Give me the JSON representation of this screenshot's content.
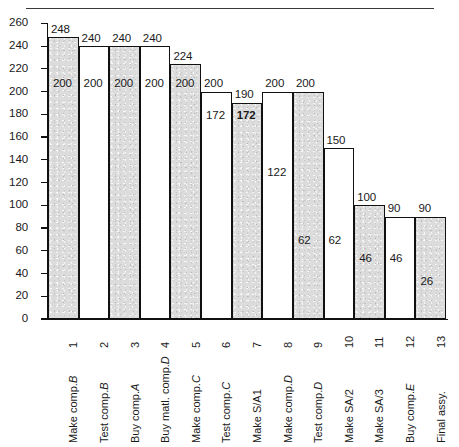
{
  "chart_data": {
    "type": "bar",
    "title": "",
    "subtitle": "",
    "xlabel": "",
    "ylabel": "",
    "ylim": [
      0,
      260
    ],
    "y_ticks": [
      0,
      20,
      40,
      60,
      80,
      100,
      120,
      140,
      160,
      180,
      200,
      220,
      240,
      260
    ],
    "grid": false,
    "legend": "none",
    "note": "Floating (range) bar chart: each bar spans from a lower value to an upper value. Bars are contiguous, alternating shaded / unshaded.",
    "categories": [
      "Make comp.B",
      "Test comp.B",
      "Buy comp.A",
      "Buy matl. comp.D",
      "Make comp.C",
      "Test comp.C",
      "Make S/A1",
      "Make comp.D",
      "Test comp.D",
      "Make SA/2",
      "Make SA/3",
      "Buy comp.E",
      "Final assy."
    ],
    "category_numbers": [
      "1",
      "2",
      "3",
      "4",
      "5",
      "6",
      "7",
      "8",
      "9",
      "10",
      "11",
      "12",
      "13"
    ],
    "series": [
      {
        "name": "lower",
        "values": [
          200,
          200,
          200,
          200,
          200,
          172,
          172,
          122,
          62,
          62,
          46,
          46,
          26
        ]
      },
      {
        "name": "upper",
        "values": [
          248,
          240,
          240,
          240,
          224,
          200,
          190,
          200,
          200,
          150,
          100,
          90,
          90
        ]
      }
    ],
    "bars": [
      {
        "index": "1",
        "label": "Make comp.B",
        "label_plain": "Make comp.",
        "label_italic": "B",
        "lower": 200,
        "upper": 248,
        "fill": "shaded",
        "lower_label": "200",
        "upper_label": "248",
        "lower_label_bold": false
      },
      {
        "index": "2",
        "label": "Test comp.B",
        "label_plain": "Test comp.",
        "label_italic": "B",
        "lower": 200,
        "upper": 240,
        "fill": "unshaded",
        "lower_label": "200",
        "upper_label": "240",
        "lower_label_bold": false
      },
      {
        "index": "3",
        "label": "Buy comp.A",
        "label_plain": "Buy comp.",
        "label_italic": "A",
        "lower": 200,
        "upper": 240,
        "fill": "shaded",
        "lower_label": "200",
        "upper_label": "240",
        "lower_label_bold": false
      },
      {
        "index": "4",
        "label": "Buy matl. comp.D",
        "label_plain": "Buy matl. comp.",
        "label_italic": "D",
        "lower": 200,
        "upper": 240,
        "fill": "unshaded",
        "lower_label": "200",
        "upper_label": "240",
        "lower_label_bold": false
      },
      {
        "index": "5",
        "label": "Make comp.C",
        "label_plain": "Make comp.",
        "label_italic": "C",
        "lower": 200,
        "upper": 224,
        "fill": "shaded",
        "lower_label": "200",
        "upper_label": "224",
        "lower_label_bold": false
      },
      {
        "index": "6",
        "label": "Test comp.C",
        "label_plain": "Test comp.",
        "label_italic": "C",
        "lower": 172,
        "upper": 200,
        "fill": "unshaded",
        "lower_label": "172",
        "upper_label": "200",
        "lower_label_bold": false
      },
      {
        "index": "7",
        "label": "Make S/A1",
        "label_plain": "Make S/A1",
        "label_italic": "",
        "lower": 172,
        "upper": 190,
        "fill": "shaded",
        "lower_label": "172",
        "upper_label": "190",
        "lower_label_bold": true
      },
      {
        "index": "8",
        "label": "Make comp.D",
        "label_plain": "Make comp.",
        "label_italic": "D",
        "lower": 122,
        "upper": 200,
        "fill": "unshaded",
        "lower_label": "122",
        "upper_label": "200",
        "lower_label_bold": false
      },
      {
        "index": "9",
        "label": "Test comp.D",
        "label_plain": "Test comp.",
        "label_italic": "D",
        "lower": 62,
        "upper": 200,
        "fill": "shaded",
        "lower_label": "62",
        "upper_label": "200",
        "lower_label_bold": false
      },
      {
        "index": "10",
        "label": "Make SA/2",
        "label_plain": "Make SA/2",
        "label_italic": "",
        "lower": 62,
        "upper": 150,
        "fill": "unshaded",
        "lower_label": "62",
        "upper_label": "150",
        "lower_label_bold": false
      },
      {
        "index": "11",
        "label": "Make SA/3",
        "label_plain": "Make SA/3",
        "label_italic": "",
        "lower": 46,
        "upper": 100,
        "fill": "shaded",
        "lower_label": "46",
        "upper_label": "100",
        "lower_label_bold": false
      },
      {
        "index": "12",
        "label": "Buy comp.E",
        "label_plain": "Buy comp.",
        "label_italic": "E",
        "lower": 46,
        "upper": 90,
        "fill": "unshaded",
        "lower_label": "46",
        "upper_label": "90",
        "lower_label_bold": false
      },
      {
        "index": "13",
        "label": "Final assy.",
        "label_plain": "Final assy.",
        "label_italic": "",
        "lower": 26,
        "upper": 90,
        "fill": "shaded",
        "lower_label": "26",
        "upper_label": "90",
        "lower_label_bold": false
      }
    ]
  },
  "colors": {
    "shaded_fill": "#dcdcdc",
    "unshaded_fill": "#ffffff",
    "outline": "#111111",
    "text": "#1a1a1a",
    "rule": "#3a3a3a"
  }
}
